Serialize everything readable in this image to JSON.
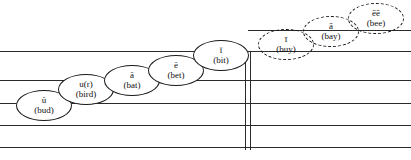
{
  "diagram": {
    "staff": {
      "line_color": "#2b2b2b",
      "lines_y": [
        51,
        80,
        103,
        125,
        147
      ],
      "ledger_line": {
        "y": 30,
        "x_start": 248,
        "x_end": 411
      },
      "barline": {
        "x": 245,
        "x2": 250,
        "y_top": 51,
        "y_bottom": 150
      }
    },
    "notes": [
      {
        "symbol": "ŭ",
        "word": "(bud)",
        "style": "solid",
        "x": 16,
        "y": 90
      },
      {
        "symbol": "u(r)",
        "word": "(bird)",
        "style": "solid",
        "x": 58,
        "y": 74
      },
      {
        "symbol": "ă",
        "word": "(bat)",
        "style": "solid",
        "x": 104,
        "y": 65
      },
      {
        "symbol": "ĕ",
        "word": "(bet)",
        "style": "solid",
        "x": 148,
        "y": 55
      },
      {
        "symbol": "ĭ",
        "word": "(bit)",
        "style": "solid",
        "x": 193,
        "y": 40
      },
      {
        "symbol": "ī",
        "word": "(buy)",
        "style": "dashed",
        "x": 258,
        "y": 29
      },
      {
        "symbol": "ā",
        "word": "(bay)",
        "style": "dashed",
        "x": 303,
        "y": 16
      },
      {
        "symbol": "ēē",
        "word": "(bee)",
        "style": "dashed",
        "x": 348,
        "y": 3
      }
    ]
  }
}
